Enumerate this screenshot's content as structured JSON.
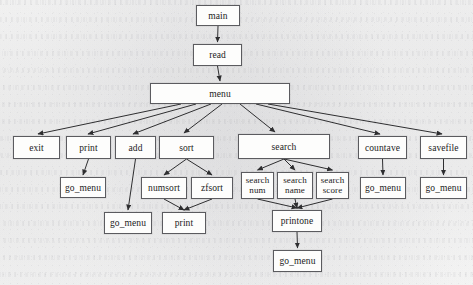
{
  "diagram": {
    "type": "call-graph",
    "style": {
      "box_border_color": "#5b5b5f",
      "box_fill_color": "#fdfdfc",
      "edge_color": "#2e2e30",
      "text_color": "#1b1b1b",
      "paper_color": "#fbfbfa"
    },
    "nodes": [
      {
        "id": "main",
        "label": "main",
        "x": 196,
        "y": 5,
        "w": 44,
        "h": 21,
        "level": 0
      },
      {
        "id": "read",
        "label": "read",
        "x": 193,
        "y": 44,
        "w": 49,
        "h": 22,
        "level": 1
      },
      {
        "id": "menu",
        "label": "menu",
        "x": 150,
        "y": 83,
        "w": 140,
        "h": 21,
        "level": 2
      },
      {
        "id": "exit",
        "label": "exit",
        "x": 13,
        "y": 136,
        "w": 47,
        "h": 23,
        "level": 3
      },
      {
        "id": "print",
        "label": "print",
        "x": 66,
        "y": 136,
        "w": 45,
        "h": 23,
        "level": 3
      },
      {
        "id": "add",
        "label": "add",
        "x": 115,
        "y": 136,
        "w": 41,
        "h": 23,
        "level": 3
      },
      {
        "id": "sort",
        "label": "sort",
        "x": 159,
        "y": 136,
        "w": 55,
        "h": 23,
        "level": 3
      },
      {
        "id": "search",
        "label": "search",
        "x": 238,
        "y": 134,
        "w": 92,
        "h": 25,
        "level": 3
      },
      {
        "id": "countave",
        "label": "countave",
        "x": 358,
        "y": 136,
        "w": 49,
        "h": 23,
        "level": 3
      },
      {
        "id": "savefile",
        "label": "savefile",
        "x": 420,
        "y": 136,
        "w": 47,
        "h": 23,
        "level": 3
      },
      {
        "id": "gm_print",
        "label": "go_menu",
        "x": 60,
        "y": 177,
        "w": 46,
        "h": 21,
        "level": 4
      },
      {
        "id": "numsort",
        "label": "numsort",
        "x": 141,
        "y": 177,
        "w": 46,
        "h": 22,
        "level": 4
      },
      {
        "id": "zfsort",
        "label": "zfsort",
        "x": 191,
        "y": 177,
        "w": 42,
        "h": 22,
        "level": 4
      },
      {
        "id": "searchnum",
        "label": "search\nnum",
        "x": 241,
        "y": 172,
        "w": 33,
        "h": 27,
        "level": 4
      },
      {
        "id": "searchname",
        "label": "search\nname",
        "x": 277,
        "y": 172,
        "w": 36,
        "h": 27,
        "level": 4
      },
      {
        "id": "searchscore",
        "label": "search\nscore",
        "x": 316,
        "y": 172,
        "w": 33,
        "h": 27,
        "level": 4
      },
      {
        "id": "gm_countave",
        "label": "go_menu",
        "x": 360,
        "y": 177,
        "w": 46,
        "h": 22,
        "level": 4
      },
      {
        "id": "gm_savefile",
        "label": "go_menu",
        "x": 420,
        "y": 177,
        "w": 47,
        "h": 22,
        "level": 4
      },
      {
        "id": "gm_add",
        "label": "go_menu",
        "x": 104,
        "y": 212,
        "w": 48,
        "h": 22,
        "level": 5
      },
      {
        "id": "print2",
        "label": "print",
        "x": 162,
        "y": 212,
        "w": 44,
        "h": 22,
        "level": 5
      },
      {
        "id": "printone",
        "label": "printone",
        "x": 272,
        "y": 210,
        "w": 50,
        "h": 22,
        "level": 5
      },
      {
        "id": "gm_printone",
        "label": "go_menu",
        "x": 273,
        "y": 250,
        "w": 49,
        "h": 22,
        "level": 6
      }
    ],
    "edges": [
      {
        "from": "main",
        "to": "read"
      },
      {
        "from": "read",
        "to": "menu"
      },
      {
        "from": "menu",
        "to": "exit"
      },
      {
        "from": "menu",
        "to": "print"
      },
      {
        "from": "menu",
        "to": "add"
      },
      {
        "from": "menu",
        "to": "sort"
      },
      {
        "from": "menu",
        "to": "search"
      },
      {
        "from": "menu",
        "to": "countave"
      },
      {
        "from": "menu",
        "to": "savefile"
      },
      {
        "from": "print",
        "to": "gm_print"
      },
      {
        "from": "add",
        "to": "gm_add"
      },
      {
        "from": "sort",
        "to": "numsort"
      },
      {
        "from": "sort",
        "to": "zfsort"
      },
      {
        "from": "numsort",
        "to": "print2"
      },
      {
        "from": "zfsort",
        "to": "print2"
      },
      {
        "from": "search",
        "to": "searchnum"
      },
      {
        "from": "search",
        "to": "searchname"
      },
      {
        "from": "search",
        "to": "searchscore"
      },
      {
        "from": "searchnum",
        "to": "printone"
      },
      {
        "from": "searchname",
        "to": "printone"
      },
      {
        "from": "searchscore",
        "to": "printone"
      },
      {
        "from": "printone",
        "to": "gm_printone"
      },
      {
        "from": "countave",
        "to": "gm_countave"
      },
      {
        "from": "savefile",
        "to": "gm_savefile"
      }
    ],
    "edge_overrides": {
      "menu->exit": {
        "x1": 181,
        "y1": 104,
        "x2": 38,
        "y2": 134
      },
      "menu->print": {
        "x1": 196,
        "y1": 104,
        "x2": 88,
        "y2": 134
      },
      "menu->add": {
        "x1": 211,
        "y1": 104,
        "x2": 133,
        "y2": 134
      },
      "menu->sort": {
        "x1": 222,
        "y1": 104,
        "x2": 184,
        "y2": 133
      },
      "menu->search": {
        "x1": 240,
        "y1": 104,
        "x2": 275,
        "y2": 132
      },
      "menu->countave": {
        "x1": 256,
        "y1": 104,
        "x2": 380,
        "y2": 134
      },
      "menu->savefile": {
        "x1": 268,
        "y1": 104,
        "x2": 442,
        "y2": 134
      }
    }
  }
}
